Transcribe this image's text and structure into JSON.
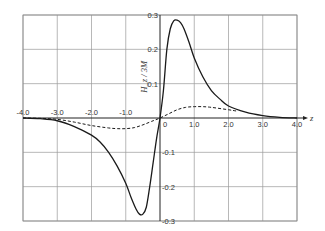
{
  "chart_data": {
    "type": "line",
    "title": "",
    "xlabel": "z",
    "ylabel": "H_z / 3M",
    "xlim": [
      -4.0,
      4.0
    ],
    "ylim": [
      -0.3,
      0.3
    ],
    "grid": true,
    "legend": "none",
    "x_ticks": [
      -4.0,
      -3.0,
      -2.0,
      -1.0,
      0,
      1.0,
      2.0,
      3.0,
      4.0
    ],
    "x_tick_labels": [
      "-4.0",
      "-3.0",
      "-2.0",
      "-1.0",
      "0",
      "1.0",
      "2.0",
      "3.0",
      "4.0"
    ],
    "y_ticks": [
      0.3,
      0.2,
      0.1,
      -0.1,
      -0.2,
      -0.3
    ],
    "y_tick_labels": [
      "0.3",
      "0.2",
      "0.1",
      "-0.1",
      "-0.2",
      "-0.3"
    ],
    "series": [
      {
        "name": "solid",
        "style": "solid",
        "x": [
          -4.0,
          -3.5,
          -3.0,
          -2.5,
          -2.0,
          -1.75,
          -1.5,
          -1.25,
          -1.0,
          -0.85,
          -0.7,
          -0.6,
          -0.5,
          -0.4,
          -0.3,
          -0.2,
          -0.1,
          0.0,
          0.1,
          0.2,
          0.3,
          0.4,
          0.5,
          0.6,
          0.7,
          0.85,
          1.0,
          1.25,
          1.5,
          1.75,
          2.0,
          2.5,
          3.0,
          3.5,
          4.0
        ],
        "y": [
          0.0,
          -0.002,
          -0.008,
          -0.025,
          -0.05,
          -0.07,
          -0.1,
          -0.14,
          -0.19,
          -0.23,
          -0.265,
          -0.28,
          -0.28,
          -0.26,
          -0.2,
          -0.13,
          -0.06,
          0.0,
          0.08,
          0.2,
          0.26,
          0.283,
          0.285,
          0.278,
          0.26,
          0.22,
          0.175,
          0.12,
          0.08,
          0.055,
          0.035,
          0.017,
          0.007,
          0.002,
          0.0
        ]
      },
      {
        "name": "dashed",
        "style": "dashed",
        "x": [
          -4.0,
          -3.5,
          -3.0,
          -2.5,
          -2.0,
          -1.5,
          -1.25,
          -1.0,
          -0.75,
          -0.5,
          -0.25,
          0.0,
          0.25,
          0.5,
          0.75,
          1.0,
          1.25,
          1.5,
          2.0,
          2.25
        ],
        "y": [
          0.0,
          -0.001,
          -0.004,
          -0.012,
          -0.022,
          -0.029,
          -0.031,
          -0.031,
          -0.028,
          -0.02,
          -0.01,
          0.0,
          0.012,
          0.024,
          0.031,
          0.033,
          0.033,
          0.031,
          0.024,
          0.02
        ]
      }
    ]
  }
}
